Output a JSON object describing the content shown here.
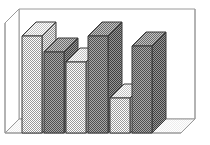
{
  "figure": {
    "name": "3d-bar-chart",
    "background": "#ffffff",
    "line_color": "#3a3a3a",
    "frame_line_color": "#8a8a8a",
    "width": 210,
    "height": 145
  },
  "chart_data": {
    "type": "bar",
    "title": "",
    "subtitle": "",
    "xlabel": "",
    "ylabel": "",
    "categories": [
      "1",
      "2",
      "3",
      "4",
      "5",
      "6"
    ],
    "values": [
      82,
      66,
      56,
      82,
      23,
      72
    ],
    "ylim": [
      0,
      100
    ],
    "grid": false,
    "legend": null,
    "annotations": [],
    "style": {
      "projection": "3d-isometric",
      "depth_dx": 14,
      "depth_dy": -14,
      "bar_fill_alternating": true,
      "fills": [
        "#c9c9c9",
        "#8f8f8f"
      ],
      "top_fills": [
        "#dedede",
        "#b0b0b0"
      ],
      "side_fills": [
        "#bdbdbd",
        "#7c7c7c"
      ],
      "hatch": "dither-checker",
      "floor_visible": true,
      "back_wall_visible": true
    },
    "tick_labels_x": [],
    "tick_labels_y": []
  },
  "frame": {
    "name": "plot-box",
    "front_left_x": 5,
    "front_bottom_y": 133,
    "back_left_x": 19,
    "back_top_y": 9,
    "front_right_x": 181,
    "back_right_x": 195
  },
  "bars": [
    {
      "name": "bar-1",
      "index": 1,
      "value": 82,
      "shade": "light",
      "front_x": 22,
      "width": 20,
      "top_y": 36
    },
    {
      "name": "bar-2",
      "index": 2,
      "value": 66,
      "shade": "dark",
      "front_x": 44,
      "width": 20,
      "top_y": 52
    },
    {
      "name": "bar-3",
      "index": 3,
      "value": 56,
      "shade": "light",
      "front_x": 66,
      "width": 20,
      "top_y": 62
    },
    {
      "name": "bar-4",
      "index": 4,
      "value": 82,
      "shade": "dark",
      "front_x": 88,
      "width": 20,
      "top_y": 36
    },
    {
      "name": "bar-5",
      "index": 5,
      "value": 23,
      "shade": "light",
      "front_x": 110,
      "width": 20,
      "top_y": 98
    },
    {
      "name": "bar-6",
      "index": 6,
      "value": 72,
      "shade": "dark",
      "front_x": 132,
      "width": 20,
      "top_y": 46
    }
  ]
}
